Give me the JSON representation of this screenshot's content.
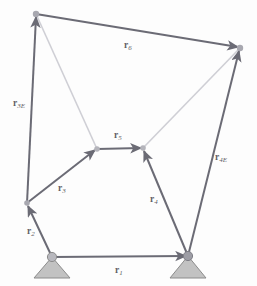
{
  "figure": {
    "background_color": "#fdfdfd",
    "vector_color": "#6b6b75",
    "faint_color": "#c9c9cf",
    "support_fill": "#c0c0c0",
    "support_stroke": "#8a8a8a",
    "joint_color": "#9a9aa2",
    "label_color": "#5f5f66"
  },
  "labels": {
    "r1": {
      "base": "r",
      "sub": "1"
    },
    "r2": {
      "base": "r",
      "sub": "2"
    },
    "r3": {
      "base": "r",
      "sub": "3"
    },
    "r4": {
      "base": "r",
      "sub": "4"
    },
    "r5": {
      "base": "r",
      "sub": "5"
    },
    "r6": {
      "base": "r",
      "sub": "6"
    },
    "r3E": {
      "base": "r",
      "sub": "3E"
    },
    "r4E": {
      "base": "r",
      "sub": "4E"
    }
  },
  "nodes": {
    "ground_left": {
      "name": "O2",
      "x": 52,
      "y": 257
    },
    "ground_right": {
      "name": "O4",
      "x": 188,
      "y": 256
    },
    "joint_a": {
      "name": "A",
      "x": 27,
      "y": 203
    },
    "joint_b": {
      "name": "B",
      "x": 97,
      "y": 149
    },
    "joint_c": {
      "name": "C",
      "x": 143,
      "y": 148
    },
    "top_left": {
      "name": "E3",
      "x": 36,
      "y": 14
    },
    "top_right": {
      "name": "E4",
      "x": 240,
      "y": 48
    }
  },
  "vectors": [
    {
      "id": "r1",
      "label": "r1",
      "from": "ground_left",
      "to": "ground_right",
      "style": "solid"
    },
    {
      "id": "r2",
      "label": "r2",
      "from": "ground_left",
      "to": "joint_a",
      "style": "solid"
    },
    {
      "id": "r3",
      "label": "r3",
      "from": "joint_a",
      "to": "joint_b",
      "style": "solid"
    },
    {
      "id": "r4",
      "label": "r4",
      "from": "ground_right",
      "to": "joint_c",
      "style": "solid"
    },
    {
      "id": "r5",
      "label": "r5",
      "from": "joint_b",
      "to": "joint_c",
      "style": "solid"
    },
    {
      "id": "r6",
      "label": "r6",
      "from": "top_left",
      "to": "top_right",
      "style": "solid"
    },
    {
      "id": "r3E",
      "label": "r3E",
      "from": "joint_a",
      "to": "top_left",
      "style": "solid"
    },
    {
      "id": "r4E",
      "label": "r4E",
      "from": "ground_right",
      "to": "top_right",
      "style": "solid"
    }
  ],
  "guides": [
    {
      "id": "guide-b-topleft",
      "from": "joint_b",
      "to": "top_left"
    },
    {
      "id": "guide-c-topright",
      "from": "joint_c",
      "to": "top_right"
    }
  ],
  "label_positions": {
    "r1": {
      "x": 115,
      "y": 266
    },
    "r2": {
      "x": 27,
      "y": 227
    },
    "r3": {
      "x": 58,
      "y": 184
    },
    "r4": {
      "x": 150,
      "y": 195
    },
    "r5": {
      "x": 114,
      "y": 131
    },
    "r6": {
      "x": 124,
      "y": 41
    },
    "r3E": {
      "x": 13,
      "y": 99
    },
    "r4E": {
      "x": 215,
      "y": 153
    }
  }
}
